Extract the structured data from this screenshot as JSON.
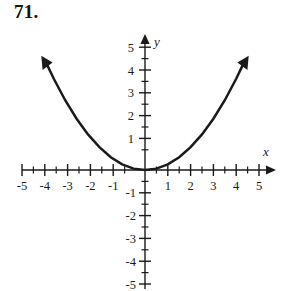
{
  "problem": {
    "number": "71."
  },
  "chart_data": {
    "type": "line",
    "title": "",
    "subtitle": "",
    "xlabel": "x",
    "ylabel": "y",
    "xlim": [
      -5.6,
      5.6
    ],
    "ylim": [
      -5.6,
      5.6
    ],
    "grid": false,
    "legend": null,
    "annotations": [],
    "axis": {
      "x_tick_labels": [
        "-5",
        "-4",
        "-3",
        "-2",
        "-1",
        "1",
        "2",
        "3",
        "4",
        "5"
      ],
      "x_tick_values": [
        -5,
        -4,
        -3,
        -2,
        -1,
        1,
        2,
        3,
        4,
        5
      ],
      "y_tick_labels": [
        "5",
        "4",
        "3",
        "2",
        "1",
        "-1",
        "-2",
        "-3",
        "-4",
        "-5"
      ],
      "y_tick_values": [
        5,
        4,
        3,
        2,
        1,
        -1,
        -2,
        -3,
        -4,
        -5
      ],
      "minor_tick_step": 0.5,
      "origin_label": "",
      "x_axis_name": "x",
      "y_axis_name": "y",
      "x_arrow": "right",
      "y_arrow": "up"
    },
    "series": [
      {
        "name": "parabola",
        "equation": "y = 0.25x^2",
        "style": "solid-curve-with-arrows",
        "color": "#1a1a1a",
        "x": [
          -4.35,
          -4.0,
          -3.5,
          -3.0,
          -2.5,
          -2.0,
          -1.5,
          -1.0,
          -0.5,
          0.0,
          0.5,
          1.0,
          1.5,
          2.0,
          2.5,
          3.0,
          3.5,
          4.0,
          4.35
        ],
        "values": [
          4.73,
          4.0,
          3.06,
          2.25,
          1.56,
          1.0,
          0.56,
          0.25,
          0.06,
          0.0,
          0.06,
          0.25,
          0.56,
          1.0,
          1.56,
          2.25,
          3.06,
          4.0,
          4.73
        ]
      }
    ],
    "vertex": [
      0,
      0
    ]
  },
  "colors": {
    "ink": "#1a1a1a",
    "background": "#ffffff"
  }
}
